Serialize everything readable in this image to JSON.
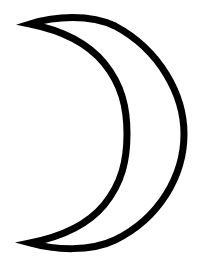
{
  "image": {
    "subject": "crescent-moon-outline",
    "colors": {
      "background": "#ffffff",
      "stroke": "#000000",
      "fill": "#ffffff"
    },
    "stroke_width": 7
  }
}
